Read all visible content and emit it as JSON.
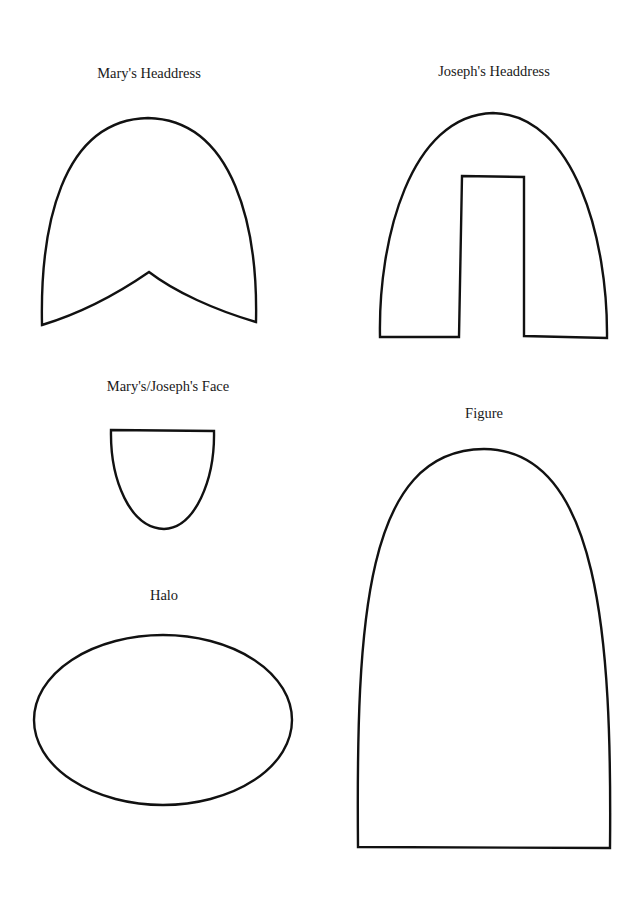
{
  "page": {
    "pieces": [
      {
        "id": "marys-headdress",
        "label": "Mary's Headdress"
      },
      {
        "id": "josephs-headdress",
        "label": "Joseph's Headdress"
      },
      {
        "id": "face",
        "label": "Mary's/Joseph's Face"
      },
      {
        "id": "figure",
        "label": "Figure"
      },
      {
        "id": "halo",
        "label": "Halo"
      }
    ]
  }
}
